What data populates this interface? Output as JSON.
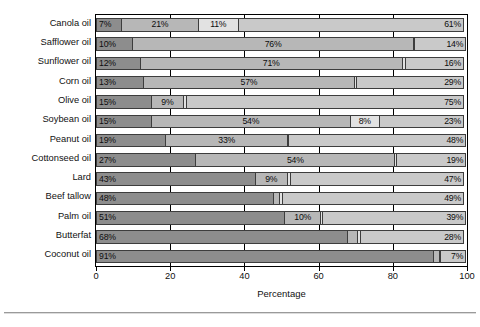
{
  "chart_data": {
    "type": "bar",
    "orientation": "horizontal",
    "stacked": true,
    "title": "",
    "xlabel": "Percentage",
    "ylabel": "",
    "xlim": [
      0,
      100
    ],
    "xticks": [
      0,
      20,
      40,
      60,
      80,
      100
    ],
    "grid": true,
    "legend": "none",
    "categories": [
      "Canola oil",
      "Safflower oil",
      "Sunflower oil",
      "Corn oil",
      "Olive oil",
      "Soybean oil",
      "Peanut oil",
      "Cottonseed oil",
      "Lard",
      "Beef tallow",
      "Palm oil",
      "Butterfat",
      "Coconut oil"
    ],
    "series": [
      {
        "name": "Saturated fat",
        "tone": "tone-dark",
        "values": [
          7,
          10,
          12,
          13,
          15,
          15,
          19,
          27,
          43,
          48,
          51,
          68,
          91
        ],
        "labels": [
          "7%",
          "10%",
          "12%",
          "13%",
          "15%",
          "15%",
          "19%",
          "27%",
          "43%",
          "48%",
          "51%",
          "68%",
          "91%"
        ]
      },
      {
        "name": "Polyunsaturated linoleic acid",
        "tone": "tone-mid",
        "values": [
          21,
          76,
          71,
          57,
          9,
          54,
          33,
          54,
          9,
          2,
          10,
          3,
          2
        ],
        "labels": [
          "21%",
          "76%",
          "71%",
          "57%",
          "9%",
          "54%",
          "33%",
          "54%",
          "9%",
          "2%",
          "10%",
          "3%",
          "2%"
        ]
      },
      {
        "name": "Polyunsaturated alpha-linolenic acid",
        "tone": "tone-light",
        "values": [
          11,
          0.6,
          1,
          1,
          1,
          8,
          0.6,
          0.6,
          1,
          1,
          0.6,
          1,
          0.6
        ],
        "labels": [
          "11%",
          "Trace",
          "1%",
          "1%",
          "1%",
          "8%",
          "Trace",
          "Trace",
          "1%",
          "1%",
          "Trace",
          "1%",
          "Trace"
        ]
      },
      {
        "name": "Monounsaturated fat",
        "tone": "tone-midlite",
        "values": [
          61,
          14,
          16,
          29,
          75,
          23,
          48,
          19,
          47,
          49,
          39,
          28,
          7
        ],
        "labels": [
          "61%",
          "14%",
          "16%",
          "29%",
          "75%",
          "23%",
          "48%",
          "19%",
          "47%",
          "49%",
          "39%",
          "28%",
          "7%"
        ]
      }
    ],
    "extra_thin_markers": {
      "note": "Sunflower, Beef tallow, Butterfat and Coconut rows show an additional very thin unlabeled divider segment",
      "rows": [
        "Sunflower oil",
        "Beef tallow",
        "Butterfat",
        "Coconut oil"
      ]
    },
    "colors": {
      "saturated": "#8d8d8d",
      "linoleic": "#b7b7b7",
      "linolenic": "#e2e2e2",
      "monounsaturated": "#c9c9c9",
      "axis": "#000000",
      "background": "#ffffff"
    }
  }
}
